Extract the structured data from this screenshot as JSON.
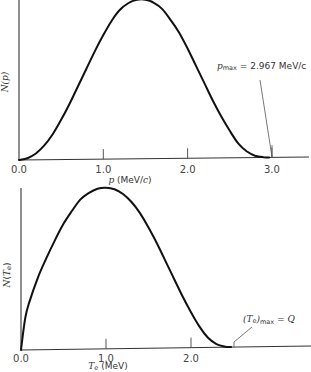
{
  "chart_data": [
    {
      "type": "line",
      "title": "",
      "xlabel": "p (MeV/c)",
      "ylabel": "N(p)",
      "x_ticks": [
        "0.0",
        "1.0",
        "2.0",
        "3.0"
      ],
      "xlim": [
        0.0,
        3.4
      ],
      "grid": false,
      "legend": null,
      "annotation": "p_max = 2.967 MeV/c",
      "annotation_parts": {
        "sym": "p",
        "sub": "max",
        "rest": " = 2.967 MeV/c"
      },
      "series": [
        {
          "name": "N(p)",
          "x": [
            0.0,
            0.1,
            0.2,
            0.3,
            0.4,
            0.5,
            0.6,
            0.7,
            0.8,
            0.9,
            1.0,
            1.1,
            1.2,
            1.3,
            1.4,
            1.5,
            1.6,
            1.7,
            1.8,
            1.9,
            2.0,
            2.1,
            2.2,
            2.3,
            2.4,
            2.5,
            2.6,
            2.7,
            2.8,
            2.9,
            2.967
          ],
          "y": [
            0.0,
            0.01,
            0.04,
            0.09,
            0.16,
            0.25,
            0.35,
            0.46,
            0.57,
            0.68,
            0.78,
            0.87,
            0.94,
            0.98,
            1.0,
            1.0,
            0.98,
            0.94,
            0.87,
            0.79,
            0.69,
            0.58,
            0.47,
            0.36,
            0.26,
            0.17,
            0.09,
            0.04,
            0.012,
            0.002,
            0.0
          ]
        }
      ]
    },
    {
      "type": "line",
      "title": "",
      "xlabel": "T_e (MeV)",
      "ylabel": "N(T_e)",
      "x_ticks": [
        "0.0",
        "1.0",
        "2.0"
      ],
      "xlim": [
        0.0,
        3.4
      ],
      "grid": false,
      "legend": null,
      "annotation": "(T_e)_max = Q",
      "annotation_parts": {
        "open": "(",
        "sym": "T",
        "symsub": "e",
        "close": ")",
        "sub": "max",
        "rest": " = Q"
      },
      "series": [
        {
          "name": "N(T_e)",
          "x": [
            0.0,
            0.05,
            0.1,
            0.2,
            0.3,
            0.4,
            0.5,
            0.6,
            0.7,
            0.8,
            0.9,
            1.0,
            1.1,
            1.2,
            1.3,
            1.4,
            1.5,
            1.6,
            1.7,
            1.8,
            1.9,
            2.0,
            2.1,
            2.2,
            2.3,
            2.4,
            2.47
          ],
          "y": [
            0.0,
            0.2,
            0.3,
            0.45,
            0.57,
            0.68,
            0.78,
            0.86,
            0.93,
            0.97,
            0.995,
            1.0,
            0.99,
            0.96,
            0.91,
            0.84,
            0.75,
            0.65,
            0.54,
            0.43,
            0.32,
            0.22,
            0.13,
            0.06,
            0.02,
            0.003,
            0.0
          ]
        }
      ]
    }
  ]
}
